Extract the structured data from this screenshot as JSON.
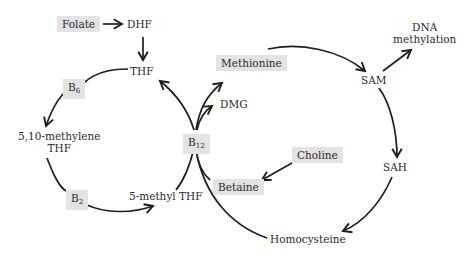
{
  "nodes": {
    "folate": "Folate",
    "dhf": "DHF",
    "thf": "THF",
    "b6": {
      "base": "B",
      "sub": "6"
    },
    "methylene_thf": [
      "5,10-methylene",
      "THF"
    ],
    "b2": {
      "base": "B",
      "sub": "2"
    },
    "methyl_thf": "5-methyl THF",
    "b12": {
      "base": "B",
      "sub": "12"
    },
    "methionine": "Methionine",
    "dmg": "DMG",
    "sam": "SAM",
    "dna_methylation": [
      "DNA",
      "methylation"
    ],
    "choline": "Choline",
    "betaine": "Betaine",
    "sah": "SAH",
    "homocysteine": "Homocysteine"
  },
  "colors": {
    "box_fill": "#e3e3e3",
    "line": "#1e1e1e",
    "text": "#2a2a2a"
  }
}
